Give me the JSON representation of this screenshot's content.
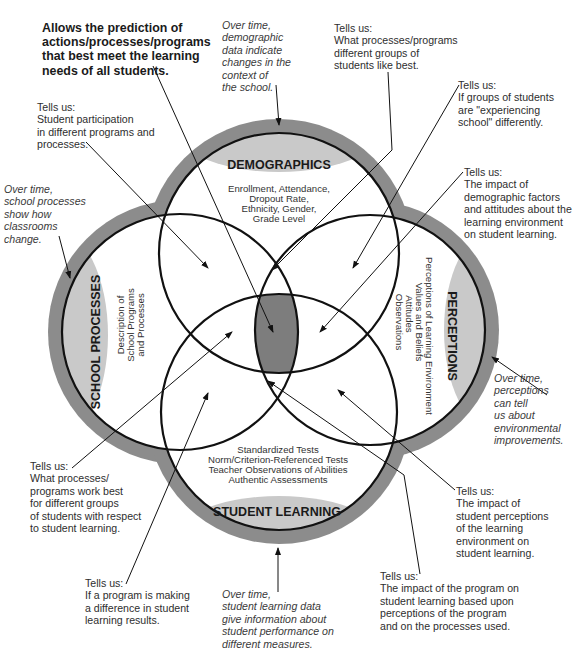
{
  "diagram": {
    "type": "four-circle venn",
    "circles": [
      {
        "id": "demographics",
        "title": "DEMOGRAPHICS",
        "items": [
          "Enrollment, Attendance,",
          "Dropout Rate,",
          "Ethnicity, Gender,",
          "Grade Level"
        ]
      },
      {
        "id": "school-processes",
        "title": "SCHOOL PROCESSES",
        "items": [
          "Description of",
          "School Programs",
          "and Processes"
        ]
      },
      {
        "id": "perceptions",
        "title": "PERCEPTIONS",
        "items": [
          "Perceptions of Learning Environment",
          "Values and Beliefs",
          "Attitudes",
          "Observations"
        ]
      },
      {
        "id": "student-learning",
        "title": "STUDENT LEARNING",
        "items": [
          "Standardized Tests",
          "Norm/Criterion-Referenced Tests",
          "Teacher Observations of Abilities",
          "Authentic Assessments"
        ]
      }
    ],
    "colors": {
      "outer_band": "#8c8c8c",
      "lens": "#c9c9c9",
      "center": "#7d7d7d",
      "stroke": "#111111"
    }
  },
  "annotations": {
    "center": "Allows the prediction of\nactions/processes/programs\nthat best meet the learning\nneeds of all students.",
    "demographics_over_time": "Over time,\ndemographic\ndata indicate\nchanges in the\ncontext of\nthe school.",
    "what_groups_like": "Tells us:\nWhat processes/programs\ndifferent groups of\nstudents like best.",
    "experiencing_school": "Tells us:\nIf groups of students\nare \"experiencing\nschool\" differently.",
    "participation": "Tells us:\nStudent participation\nin different programs and\nprocesses.",
    "demographic_factors": "Tells us:\nThe impact of\ndemographic factors\nand attitudes about the\nlearning environment\non student learning.",
    "school_over_time": "Over time,\nschool processes\nshow how\nclassrooms\nchange.",
    "perceptions_over_time": "Over time,\nperceptions\ncan tell\nus about\nenvironmental\nimprovements.",
    "work_best": "Tells us:\nWhat processes/\nprograms work best\nfor different groups\nof students with respect\nto student learning.",
    "student_perceptions": "Tells us:\nThe impact of\nstudent perceptions\nof the learning\nenvironment on\nstudent learning.",
    "program_difference": "Tells us:\nIf a program is making\na difference in student\nlearning results.",
    "learning_over_time": "Over time,\nstudent learning data\ngive information about\nstudent performance on\ndifferent measures.",
    "program_impact": "Tells us:\nThe impact of the program on\nstudent learning based upon\nperceptions of the program\nand on the processes used."
  }
}
